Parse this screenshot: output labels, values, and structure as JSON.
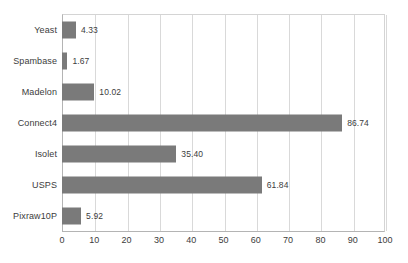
{
  "chart_data": {
    "type": "bar",
    "orientation": "horizontal",
    "title": "",
    "subtitle": "",
    "xlabel": "",
    "ylabel": "",
    "xlim": [
      0,
      100
    ],
    "xticks": [
      0,
      10,
      20,
      30,
      40,
      50,
      60,
      70,
      80,
      90,
      100
    ],
    "xtick_labels": [
      "0",
      "10",
      "20",
      "30",
      "40",
      "50",
      "60",
      "70",
      "80",
      "90",
      "100"
    ],
    "grid": "vertical",
    "legend": "none",
    "categories": [
      "Yeast",
      "Spambase",
      "Madelon",
      "Connect4",
      "Isolet",
      "USPS",
      "Pixraw10P"
    ],
    "values": [
      4.33,
      1.67,
      10.02,
      86.74,
      35.4,
      61.84,
      5.92
    ],
    "value_labels": [
      "4.33",
      "1.67",
      "10.02",
      "86.74",
      "35.40",
      "61.84",
      "5.92"
    ],
    "bar_color": "#7a7a7a",
    "gridline_color": "#d9d9d9",
    "axis_color": "#b4b4b4",
    "text_color": "#3c3c3c",
    "background_color": "#ffffff"
  }
}
